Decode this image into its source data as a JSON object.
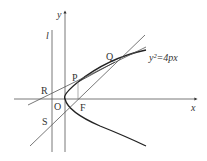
{
  "diagram": {
    "curve_label": "y²=4px",
    "axes": {
      "x_label": "x",
      "y_label": "y"
    },
    "directrix_label": "l",
    "points": {
      "O": "O",
      "F": "F",
      "P": "P",
      "Q": "Q",
      "R": "R",
      "S": "S"
    },
    "colors": {
      "stroke": "#333333",
      "background": "#ffffff"
    }
  }
}
